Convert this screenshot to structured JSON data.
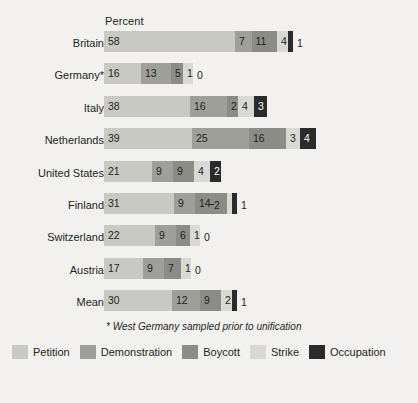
{
  "header": {
    "axis_title": "Percent"
  },
  "footnote": "* West Germany sampled prior to unification",
  "colors": {
    "petition": "#c9c9c4",
    "demonstration": "#9f9f9a",
    "boycott": "#8c8c87",
    "strike": "#d9d9d4",
    "occupation": "#2b2b2b",
    "text": "#231f20",
    "background": "#f2f1ef"
  },
  "legend": [
    {
      "label": "Petition",
      "color": "#c9c9c4",
      "key": "petition"
    },
    {
      "label": "Demonstration",
      "color": "#9f9f9a",
      "key": "demonstration"
    },
    {
      "label": "Boycott",
      "color": "#8c8c87",
      "key": "boycott"
    },
    {
      "label": "Strike",
      "color": "#d9d9d4",
      "key": "strike"
    },
    {
      "label": "Occupation",
      "color": "#2b2b2b",
      "key": "occupation"
    }
  ],
  "chart_data": {
    "type": "bar",
    "orientation": "horizontal",
    "stacked": true,
    "title": "",
    "xlabel": "Percent",
    "ylabel": "",
    "xlim": [
      0,
      85
    ],
    "grid": false,
    "legend_position": "bottom",
    "categories": [
      "Britain",
      "Germany*",
      "Italy",
      "Netherlands",
      "United States",
      "Finland",
      "Switzerland",
      "Austria",
      "Mean"
    ],
    "series": [
      {
        "name": "Petition",
        "values": [
          58,
          16,
          38,
          39,
          21,
          31,
          22,
          17,
          30
        ]
      },
      {
        "name": "Demonstration",
        "values": [
          7,
          13,
          16,
          25,
          9,
          9,
          9,
          9,
          12
        ]
      },
      {
        "name": "Boycott",
        "values": [
          11,
          5,
          2,
          16,
          9,
          14,
          6,
          7,
          9
        ]
      },
      {
        "name": "Strike",
        "values": [
          4,
          1,
          4,
          3,
          4,
          2,
          1,
          1,
          2
        ]
      },
      {
        "name": "Occupation",
        "values": [
          1,
          0,
          3,
          4,
          2,
          1,
          0,
          0,
          1
        ]
      }
    ]
  },
  "rows": [
    {
      "label": "Britain",
      "segments": [
        {
          "key": "petition",
          "value": "58",
          "width": 131.0,
          "label_inside": true,
          "dark": false
        },
        {
          "key": "demonstration",
          "value": "7",
          "width": 16.5,
          "label_inside": true,
          "dark": false
        },
        {
          "key": "boycott",
          "value": "11",
          "width": 25.5,
          "label_inside": true,
          "dark": false
        },
        {
          "key": "strike",
          "value": "4",
          "width": 11.0,
          "label_inside": true,
          "dark": false
        },
        {
          "key": "occupation",
          "value": "1",
          "width": 5.0,
          "label_inside": false,
          "dark": true
        }
      ]
    },
    {
      "label": "Germany*",
      "segments": [
        {
          "key": "petition",
          "value": "16",
          "width": 37.0,
          "label_inside": true,
          "dark": false
        },
        {
          "key": "demonstration",
          "value": "13",
          "width": 30.0,
          "label_inside": true,
          "dark": false
        },
        {
          "key": "boycott",
          "value": "5",
          "width": 12.0,
          "label_inside": true,
          "dark": false
        },
        {
          "key": "strike",
          "value": "1",
          "width": 10.0,
          "label_inside": true,
          "dark": false
        },
        {
          "key": "occupation",
          "value": "0",
          "width": 0.0,
          "label_inside": false,
          "dark": true
        }
      ]
    },
    {
      "label": "Italy",
      "segments": [
        {
          "key": "petition",
          "value": "38",
          "width": 86.0,
          "label_inside": true,
          "dark": false
        },
        {
          "key": "demonstration",
          "value": "16",
          "width": 37.0,
          "label_inside": true,
          "dark": false
        },
        {
          "key": "boycott",
          "value": "2",
          "width": 11.0,
          "label_inside": true,
          "dark": false
        },
        {
          "key": "strike",
          "value": "4",
          "width": 16.0,
          "label_inside": true,
          "dark": false
        },
        {
          "key": "occupation",
          "value": "3",
          "width": 13.0,
          "label_inside": true,
          "dark": true
        }
      ]
    },
    {
      "label": "Netherlands",
      "segments": [
        {
          "key": "petition",
          "value": "39",
          "width": 88.0,
          "label_inside": true,
          "dark": false
        },
        {
          "key": "demonstration",
          "value": "25",
          "width": 57.0,
          "label_inside": true,
          "dark": false
        },
        {
          "key": "boycott",
          "value": "16",
          "width": 37.0,
          "label_inside": true,
          "dark": false
        },
        {
          "key": "strike",
          "value": "3",
          "width": 14.0,
          "label_inside": true,
          "dark": false
        },
        {
          "key": "occupation",
          "value": "4",
          "width": 16.0,
          "label_inside": true,
          "dark": true
        }
      ]
    },
    {
      "label": "United States",
      "segments": [
        {
          "key": "petition",
          "value": "21",
          "width": 48.0,
          "label_inside": true,
          "dark": false
        },
        {
          "key": "demonstration",
          "value": "9",
          "width": 21.0,
          "label_inside": true,
          "dark": false
        },
        {
          "key": "boycott",
          "value": "9",
          "width": 21.0,
          "label_inside": true,
          "dark": false
        },
        {
          "key": "strike",
          "value": "4",
          "width": 16.0,
          "label_inside": true,
          "dark": false
        },
        {
          "key": "occupation",
          "value": "2",
          "width": 11.0,
          "label_inside": true,
          "dark": true
        }
      ]
    },
    {
      "label": "Finland",
      "segments": [
        {
          "key": "petition",
          "value": "31",
          "width": 70.0,
          "label_inside": true,
          "dark": false
        },
        {
          "key": "demonstration",
          "value": "9",
          "width": 21.0,
          "label_inside": true,
          "dark": false
        },
        {
          "key": "boycott",
          "value": "14",
          "width": 32.0,
          "label_inside": true,
          "dark": false
        },
        {
          "key": "strike",
          "value": "2",
          "width": 5.0,
          "label_inside": false,
          "dark": false,
          "leader": true
        },
        {
          "key": "occupation",
          "value": "1",
          "width": 5.0,
          "label_inside": false,
          "dark": true
        }
      ]
    },
    {
      "label": "Switzerland",
      "segments": [
        {
          "key": "petition",
          "value": "22",
          "width": 51.0,
          "label_inside": true,
          "dark": false
        },
        {
          "key": "demonstration",
          "value": "9",
          "width": 21.0,
          "label_inside": true,
          "dark": false
        },
        {
          "key": "boycott",
          "value": "6",
          "width": 14.0,
          "label_inside": true,
          "dark": false
        },
        {
          "key": "strike",
          "value": "1",
          "width": 10.0,
          "label_inside": true,
          "dark": false
        },
        {
          "key": "occupation",
          "value": "0",
          "width": 0.0,
          "label_inside": false,
          "dark": true
        }
      ]
    },
    {
      "label": "Austria",
      "segments": [
        {
          "key": "petition",
          "value": "17",
          "width": 39.0,
          "label_inside": true,
          "dark": false
        },
        {
          "key": "demonstration",
          "value": "9",
          "width": 21.0,
          "label_inside": true,
          "dark": false
        },
        {
          "key": "boycott",
          "value": "7",
          "width": 17.0,
          "label_inside": true,
          "dark": false
        },
        {
          "key": "strike",
          "value": "1",
          "width": 10.0,
          "label_inside": true,
          "dark": false
        },
        {
          "key": "occupation",
          "value": "0",
          "width": 0.0,
          "label_inside": false,
          "dark": true
        }
      ]
    },
    {
      "label": "Mean",
      "segments": [
        {
          "key": "petition",
          "value": "30",
          "width": 68.0,
          "label_inside": true,
          "dark": false
        },
        {
          "key": "demonstration",
          "value": "12",
          "width": 28.0,
          "label_inside": true,
          "dark": false
        },
        {
          "key": "boycott",
          "value": "9",
          "width": 21.0,
          "label_inside": true,
          "dark": false
        },
        {
          "key": "strike",
          "value": "2",
          "width": 11.0,
          "label_inside": true,
          "dark": false
        },
        {
          "key": "occupation",
          "value": "1",
          "width": 5.0,
          "label_inside": false,
          "dark": true
        }
      ]
    }
  ]
}
